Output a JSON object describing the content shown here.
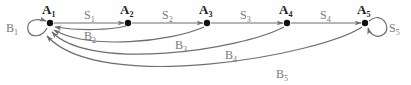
{
  "diagram": {
    "type": "state-transition",
    "colors": {
      "edge": "#6e6e6e",
      "node": "#111111",
      "node_label": "#222222",
      "edge_label": "#7a7a7a"
    },
    "nodes": [
      {
        "id": "A1",
        "base": "A",
        "sub": "1"
      },
      {
        "id": "A2",
        "base": "A",
        "sub": "2"
      },
      {
        "id": "A3",
        "base": "A",
        "sub": "3"
      },
      {
        "id": "A4",
        "base": "A",
        "sub": "4"
      },
      {
        "id": "A5",
        "base": "A",
        "sub": "5"
      }
    ],
    "edges": [
      {
        "id": "S1",
        "base": "S",
        "sub": "1",
        "from": "A1",
        "to": "A2"
      },
      {
        "id": "S2",
        "base": "S",
        "sub": "2",
        "from": "A2",
        "to": "A3"
      },
      {
        "id": "S3",
        "base": "S",
        "sub": "3",
        "from": "A3",
        "to": "A4"
      },
      {
        "id": "S4",
        "base": "S",
        "sub": "4",
        "from": "A4",
        "to": "A5"
      },
      {
        "id": "S5",
        "base": "S",
        "sub": "5",
        "from": "A5",
        "to": "A5"
      },
      {
        "id": "B1",
        "base": "B",
        "sub": "1",
        "from": "A1",
        "to": "A1"
      },
      {
        "id": "B2",
        "base": "B",
        "sub": "2",
        "from": "A2",
        "to": "A1"
      },
      {
        "id": "B3",
        "base": "B",
        "sub": "3",
        "from": "A3",
        "to": "A1"
      },
      {
        "id": "B4",
        "base": "B",
        "sub": "4",
        "from": "A4",
        "to": "A1"
      },
      {
        "id": "B5",
        "base": "B",
        "sub": "5",
        "from": "A5",
        "to": "A1"
      }
    ]
  }
}
